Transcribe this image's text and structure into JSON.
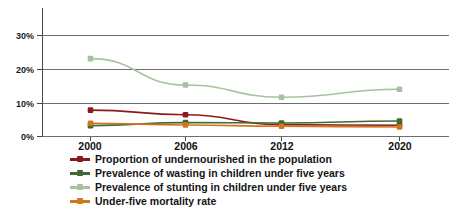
{
  "chart_data": {
    "type": "line",
    "title": "",
    "xlabel": "",
    "ylabel": "",
    "categories": [
      "2000",
      "2006",
      "2012",
      "2020"
    ],
    "x": [
      2000,
      2006,
      2012,
      2020
    ],
    "ylim": [
      0,
      35
    ],
    "xlim": [
      1997,
      2023
    ],
    "yticks": [
      0,
      10,
      20,
      30
    ],
    "ytick_labels": [
      "0%",
      "10%",
      "20%",
      "30%"
    ],
    "grid": true,
    "legend_position": "bottom-left",
    "series": [
      {
        "name": "Proportion of undernourished in the population",
        "color": "#8B1A1A",
        "values": [
          8.0,
          6.6,
          3.6,
          3.4
        ]
      },
      {
        "name": "Prevalence of wasting in children under five years",
        "color": "#3F6B32",
        "values": [
          3.3,
          4.2,
          4.1,
          4.7
        ]
      },
      {
        "name": "Prevalence of stunting in children under five years",
        "color": "#A6C3A0",
        "values": [
          23.6,
          15.6,
          11.9,
          14.3
        ]
      },
      {
        "name": "Under-five mortality rate",
        "color": "#D2761E",
        "values": [
          4.0,
          3.5,
          3.1,
          2.9
        ]
      }
    ]
  },
  "axis": {
    "ytick_0": "0%",
    "ytick_10": "10%",
    "ytick_20": "20%",
    "ytick_30": "30%",
    "xtick_2000": "2000",
    "xtick_2006": "2006",
    "xtick_2012": "2012",
    "xtick_2020": "2020"
  },
  "legend": {
    "items": [
      {
        "label": "Proportion of undernourished in the population",
        "color": "#8B1A1A"
      },
      {
        "label": "Prevalence of wasting in children under five years",
        "color": "#3F6B32"
      },
      {
        "label": "Prevalence of stunting in children under five years",
        "color": "#A6C3A0"
      },
      {
        "label": "Under-five mortality rate",
        "color": "#D2761E"
      }
    ]
  }
}
